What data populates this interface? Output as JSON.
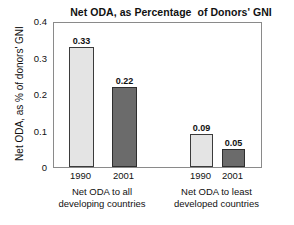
{
  "chart_data": {
    "type": "bar",
    "title": "Net ODA, as Percentage  of Donors' GNI",
    "xlabel": "",
    "ylabel": "Net ODA, as % of donors' GNI",
    "ylim": [
      0,
      0.4
    ],
    "grid": false,
    "legend": "none",
    "y_ticks": [
      "0.4",
      "0.3",
      "0.2",
      "0.1",
      "0"
    ],
    "y_tick_values": [
      0.4,
      0.3,
      0.2,
      0.1,
      0
    ],
    "categories": [
      "1990",
      "2001",
      "1990",
      "2001"
    ],
    "values": [
      0.33,
      0.22,
      0.09,
      0.05
    ],
    "value_labels": [
      "0.33",
      "0.22",
      "0.09",
      "0.05"
    ],
    "groups": [
      {
        "caption_line1": "Net ODA to all",
        "caption_line2": "developing countries",
        "bars": [
          {
            "category": "1990",
            "value": 0.33,
            "label": "0.33",
            "style": "light"
          },
          {
            "category": "2001",
            "value": 0.22,
            "label": "0.22",
            "style": "dark"
          }
        ]
      },
      {
        "caption_line1": "Net ODA to least",
        "caption_line2": "developed countries",
        "bars": [
          {
            "category": "1990",
            "value": 0.09,
            "label": "0.09",
            "style": "light"
          },
          {
            "category": "2001",
            "value": 0.05,
            "label": "0.05",
            "style": "dark"
          }
        ]
      }
    ],
    "colors": {
      "bar_light": "#e4e4e4",
      "bar_dark": "#6b6b6b",
      "bar_outline": "#3b3b3b",
      "frame": "#8a8a8a",
      "text": "#111111",
      "background": "#ffffff"
    }
  }
}
